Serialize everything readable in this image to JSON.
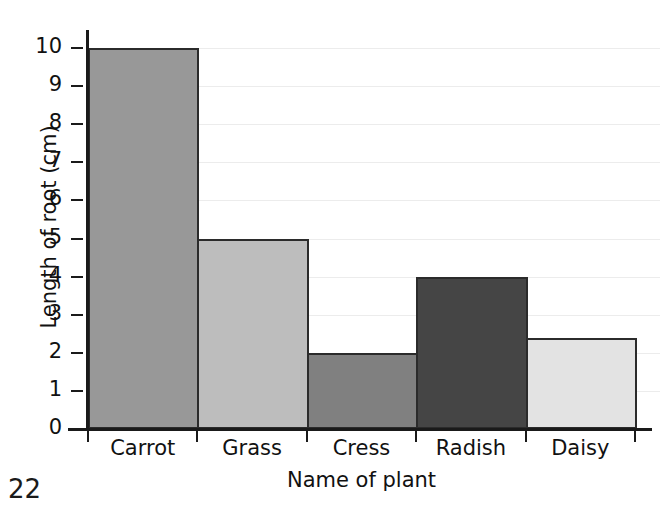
{
  "page": {
    "number": "22"
  },
  "chart_data": {
    "type": "bar",
    "title": "",
    "subtitle": "",
    "xlabel": "Name of plant",
    "ylabel": "Length of root (cm)",
    "categories": [
      "Carrot",
      "Grass",
      "Cress",
      "Radish",
      "Daisy"
    ],
    "values": [
      10,
      5,
      2,
      4,
      2.4
    ],
    "series": [
      {
        "name": "Length of root (cm)",
        "values": [
          10,
          5,
          2,
          4,
          2.4
        ]
      }
    ],
    "bar_colors": [
      "#989898",
      "#bdbdbd",
      "#808080",
      "#454545",
      "#e3e3e3"
    ],
    "bar_outline_color": "#2b2b2b",
    "ylim": [
      0,
      10
    ],
    "ytick_labels": [
      "0",
      "1",
      "2",
      "3",
      "4",
      "5",
      "6",
      "7",
      "8",
      "9",
      "10"
    ],
    "ytick_values": [
      0,
      1,
      2,
      3,
      4,
      5,
      6,
      7,
      8,
      9,
      10
    ],
    "grid": true,
    "grid_color": "#ececec",
    "legend": false,
    "legend_position": "none",
    "bars_adjacent": true,
    "axis_color": "#1a1a1a"
  }
}
